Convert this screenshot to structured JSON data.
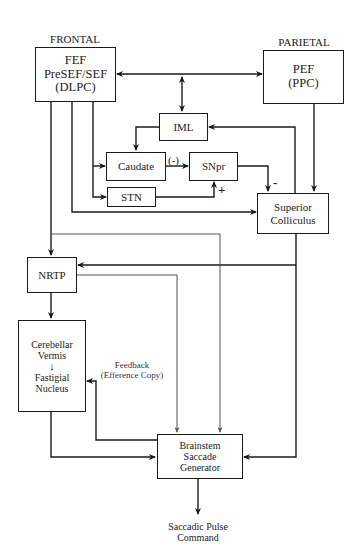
{
  "regions": {
    "frontal": "FRONTAL",
    "parietal": "PARIETAL"
  },
  "nodes": {
    "fef": {
      "lines": [
        "FEF",
        "PreSEF/SEF",
        "(DLPC)"
      ]
    },
    "pef": {
      "lines": [
        "PEF",
        "(PPC)"
      ]
    },
    "iml": {
      "label": "IML"
    },
    "caudate": {
      "label": "Caudate"
    },
    "snpr": {
      "label": "SNpr"
    },
    "stn": {
      "label": "STN"
    },
    "superior_colliculus": {
      "lines": [
        "Superior",
        "Colliculus"
      ]
    },
    "nrtp": {
      "label": "NRTP"
    },
    "cerebellar": {
      "lines": [
        "Cerebellar",
        "Vermis",
        "Fastigial",
        "Nucleus"
      ]
    },
    "brainstem": {
      "lines": [
        "Brainstem",
        "Saccade",
        "Generator"
      ]
    }
  },
  "edge_labels": {
    "caudate_to_snpr": "(-)",
    "stn_to_snpr": "+",
    "snpr_to_sc": "-",
    "feedback": [
      "Feedback",
      "(Efference Copy)"
    ]
  },
  "output": {
    "lines": [
      "Saccadic Pulse",
      "Command"
    ]
  },
  "colors": {
    "line": "#1a1a1a",
    "thin_line": "#555555",
    "background": "#ffffff"
  }
}
